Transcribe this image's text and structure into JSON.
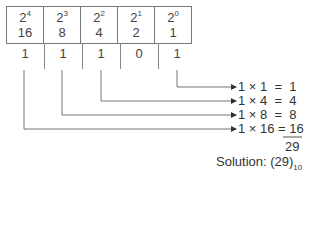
{
  "table": {
    "columns": [
      {
        "base": "2",
        "exp": "4",
        "value": "16"
      },
      {
        "base": "2",
        "exp": "3",
        "value": "8"
      },
      {
        "base": "2",
        "exp": "2",
        "value": "4"
      },
      {
        "base": "2",
        "exp": "1",
        "value": "2"
      },
      {
        "base": "2",
        "exp": "0",
        "value": "1"
      }
    ]
  },
  "bits": [
    "1",
    "1",
    "1",
    "0",
    "1"
  ],
  "equations": [
    "1 × 1  =  1",
    "1 × 4  =  4",
    "1 × 8  =  8",
    "1 × 16 = 16"
  ],
  "total": "29",
  "solution": {
    "label": "Solution: (29)",
    "subscript": "10"
  }
}
